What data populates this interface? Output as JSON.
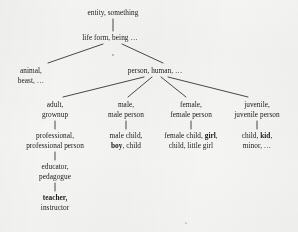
{
  "figure": {
    "type": "hypernym-tree",
    "background_color": "#f3f3f1",
    "line_color": "#2a2a2a",
    "text_color": "#1b1b1b"
  },
  "nodes": {
    "entity": {
      "id": "entity",
      "x": 113,
      "y": 8,
      "lines": [
        [
          {
            "t": "entity, something",
            "bold": false
          }
        ]
      ]
    },
    "life_form": {
      "id": "life-form",
      "x": 110,
      "y": 33,
      "lines": [
        [
          {
            "t": "life form, being …",
            "bold": false
          }
        ]
      ]
    },
    "animal": {
      "id": "animal",
      "x": 31,
      "y": 66,
      "lines": [
        [
          {
            "t": "animal,",
            "bold": false
          }
        ],
        [
          {
            "t": "beast, …",
            "bold": false
          }
        ]
      ]
    },
    "person": {
      "id": "person",
      "x": 155,
      "y": 66,
      "lines": [
        [
          {
            "t": "person, human, …",
            "bold": false
          }
        ]
      ]
    },
    "adult": {
      "id": "adult",
      "x": 55,
      "y": 100,
      "lines": [
        [
          {
            "t": "adult,",
            "bold": false
          }
        ],
        [
          {
            "t": "grownup",
            "bold": false
          }
        ]
      ]
    },
    "male": {
      "id": "male",
      "x": 126,
      "y": 100,
      "lines": [
        [
          {
            "t": "male,",
            "bold": false
          }
        ],
        [
          {
            "t": "male person",
            "bold": false
          }
        ]
      ]
    },
    "female": {
      "id": "female",
      "x": 191,
      "y": 100,
      "lines": [
        [
          {
            "t": "female,",
            "bold": false
          }
        ],
        [
          {
            "t": "female person",
            "bold": false
          }
        ]
      ]
    },
    "juvenile": {
      "id": "juvenile",
      "x": 257,
      "y": 100,
      "lines": [
        [
          {
            "t": "juvenile,",
            "bold": false
          }
        ],
        [
          {
            "t": "juvenile person",
            "bold": false
          }
        ]
      ]
    },
    "professional": {
      "id": "professional",
      "x": 55,
      "y": 131,
      "lines": [
        [
          {
            "t": "professional,",
            "bold": false
          }
        ],
        [
          {
            "t": "professional person",
            "bold": false
          }
        ]
      ]
    },
    "male_child": {
      "id": "male-child",
      "x": 126,
      "y": 131,
      "lines": [
        [
          {
            "t": "male child,",
            "bold": false
          }
        ],
        [
          {
            "t": "boy",
            "bold": true
          },
          {
            "t": ", child",
            "bold": false
          }
        ]
      ]
    },
    "female_child": {
      "id": "female-child",
      "x": 191,
      "y": 131,
      "lines": [
        [
          {
            "t": "female child, ",
            "bold": false
          },
          {
            "t": "girl",
            "bold": true
          },
          {
            "t": ",",
            "bold": false
          }
        ],
        [
          {
            "t": "child, little girl",
            "bold": false
          }
        ]
      ]
    },
    "child_kid": {
      "id": "child-kid",
      "x": 257,
      "y": 131,
      "lines": [
        [
          {
            "t": "child, ",
            "bold": false
          },
          {
            "t": "kid",
            "bold": true
          },
          {
            "t": ",",
            "bold": false
          }
        ],
        [
          {
            "t": "minor, …",
            "bold": false
          }
        ]
      ]
    },
    "educator": {
      "id": "educator",
      "x": 55,
      "y": 162,
      "lines": [
        [
          {
            "t": "educator,",
            "bold": false
          }
        ],
        [
          {
            "t": "pedagogue",
            "bold": false
          }
        ]
      ]
    },
    "teacher": {
      "id": "teacher",
      "x": 55,
      "y": 193,
      "lines": [
        [
          {
            "t": "teacher,",
            "bold": true
          }
        ],
        [
          {
            "t": "instructor",
            "bold": false
          }
        ]
      ]
    }
  },
  "edges": [
    {
      "id": "entity-to-life-form",
      "from": "entity",
      "to": "life_form",
      "x1": 113,
      "y1": 19,
      "x2": 113,
      "y2": 31
    },
    {
      "id": "life-form-to-animal",
      "from": "life_form",
      "to": "animal",
      "x1": 103,
      "y1": 44,
      "x2": 48,
      "y2": 63
    },
    {
      "id": "life-form-to-person",
      "from": "life_form",
      "to": "person",
      "x1": 122,
      "y1": 44,
      "x2": 163,
      "y2": 63
    },
    {
      "id": "person-to-adult",
      "from": "person",
      "to": "adult",
      "x1": 144,
      "y1": 77,
      "x2": 63,
      "y2": 97
    },
    {
      "id": "person-to-male",
      "from": "person",
      "to": "male",
      "x1": 152,
      "y1": 77,
      "x2": 128,
      "y2": 97
    },
    {
      "id": "person-to-female",
      "from": "person",
      "to": "female",
      "x1": 161,
      "y1": 77,
      "x2": 186,
      "y2": 97
    },
    {
      "id": "person-to-juvenile",
      "from": "person",
      "to": "juvenile",
      "x1": 168,
      "y1": 77,
      "x2": 248,
      "y2": 97
    },
    {
      "id": "adult-to-professional",
      "from": "adult",
      "to": "professional",
      "x1": 55,
      "y1": 121,
      "x2": 55,
      "y2": 129
    },
    {
      "id": "male-to-male-child",
      "from": "male",
      "to": "male_child",
      "x1": 126,
      "y1": 121,
      "x2": 126,
      "y2": 129
    },
    {
      "id": "female-to-female-child",
      "from": "female",
      "to": "female_child",
      "x1": 191,
      "y1": 121,
      "x2": 191,
      "y2": 129
    },
    {
      "id": "juvenile-to-child-kid",
      "from": "juvenile",
      "to": "child_kid",
      "x1": 257,
      "y1": 121,
      "x2": 257,
      "y2": 129
    },
    {
      "id": "professional-to-educator",
      "from": "professional",
      "to": "educator",
      "x1": 55,
      "y1": 152,
      "x2": 55,
      "y2": 160
    },
    {
      "id": "educator-to-teacher",
      "from": "educator",
      "to": "teacher",
      "x1": 55,
      "y1": 183,
      "x2": 55,
      "y2": 191
    }
  ],
  "marks": [
    {
      "id": "speck-center",
      "x": 113,
      "y": 55,
      "r": 0.7
    },
    {
      "id": "speck-bottom",
      "x": 186,
      "y": 223,
      "r": 0.6
    }
  ]
}
